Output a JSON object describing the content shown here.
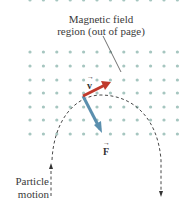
{
  "diagram": {
    "title_line1": "Magnetic field",
    "title_line2": "region (out of page)",
    "label_particle": "Particle",
    "label_motion": "motion",
    "v_label": "v",
    "f_label": "F",
    "colors": {
      "dots": "#9fc3bd",
      "velocity": "#c0392b",
      "force": "#5b8fae",
      "path": "#333333"
    }
  }
}
